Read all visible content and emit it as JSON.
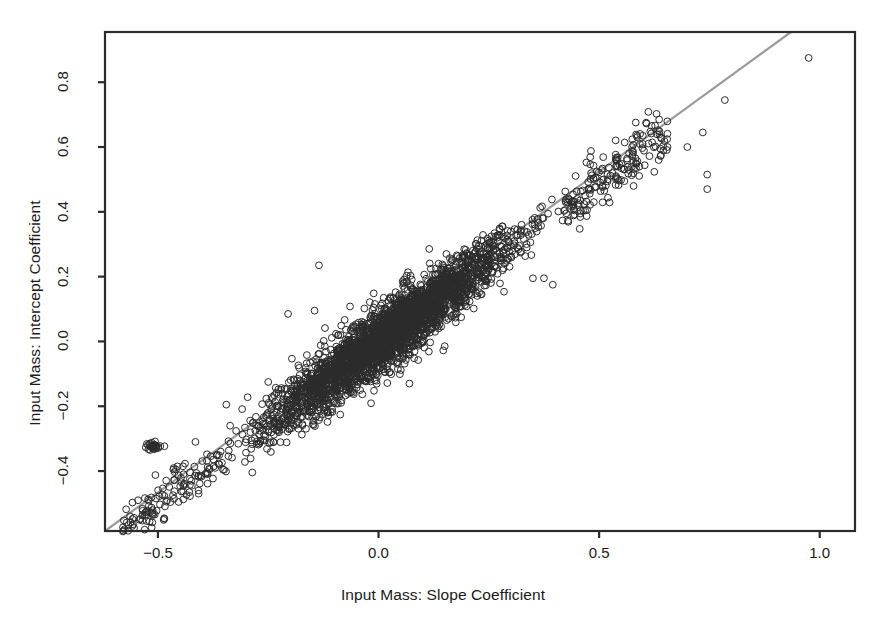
{
  "chart_data": {
    "type": "scatter",
    "title": "",
    "xlabel": "Input Mass: Slope Coefficient",
    "ylabel": "Input Mass: Intercept Coefficient",
    "xlim": [
      -0.62,
      1.08
    ],
    "ylim": [
      -0.585,
      0.955
    ],
    "xticks": [
      -0.5,
      0.0,
      0.5,
      1.0
    ],
    "xticklabels": [
      "−0.5",
      "0.0",
      "0.5",
      "1.0"
    ],
    "yticks": [
      -0.4,
      -0.2,
      0.0,
      0.2,
      0.4,
      0.6,
      0.8
    ],
    "yticklabels": [
      "−0.4",
      "−0.2",
      "0.0",
      "0.2",
      "0.4",
      "0.6",
      "0.8"
    ],
    "grid": false,
    "legend": null,
    "marker": {
      "shape": "open-circle",
      "radius_px": 3.4,
      "stroke": "#2b2b2b",
      "stroke_width": 1.0,
      "fill": "none"
    },
    "reference_line": {
      "label": "identity / fitted line",
      "color": "#9c9c9c",
      "width_px": 2.2,
      "x_start": -0.62,
      "y_start": -0.585,
      "x_end": 0.935,
      "y_end": 0.955
    },
    "relationship": {
      "description": "Near 1:1 positive linear association between slope and intercept coefficients",
      "slope": 1.0,
      "intercept": 0.0,
      "n_points": 3000
    },
    "point_cloud": {
      "core_x_range": [
        -0.56,
        0.62
      ],
      "core_y_range": [
        -0.57,
        0.62
      ],
      "scatter_sd": 0.032,
      "density_peak_x": 0.02,
      "density_peak_y": 0.02
    },
    "outlier_blob": {
      "x": -0.512,
      "y": -0.322,
      "n_points": 26,
      "spread_x": 0.012,
      "spread_y": 0.007
    },
    "notable_outliers": [
      {
        "x": 0.975,
        "y": 0.875
      },
      {
        "x": 0.785,
        "y": 0.745
      },
      {
        "x": 0.735,
        "y": 0.645
      },
      {
        "x": 0.7,
        "y": 0.6
      },
      {
        "x": 0.745,
        "y": 0.515
      },
      {
        "x": 0.745,
        "y": 0.47
      },
      {
        "x": 0.655,
        "y": 0.6
      },
      {
        "x": 0.635,
        "y": 0.56
      },
      {
        "x": -0.135,
        "y": 0.235
      },
      {
        "x": -0.145,
        "y": 0.095
      },
      {
        "x": -0.205,
        "y": 0.085
      },
      {
        "x": 0.35,
        "y": 0.195
      },
      {
        "x": 0.375,
        "y": 0.195
      },
      {
        "x": 0.395,
        "y": 0.175
      },
      {
        "x": 0.3,
        "y": 0.34
      },
      {
        "x": 0.275,
        "y": 0.345
      },
      {
        "x": -0.25,
        "y": -0.125
      },
      {
        "x": -0.345,
        "y": -0.195
      },
      {
        "x": -0.415,
        "y": -0.31
      },
      {
        "x": -0.465,
        "y": -0.395
      },
      {
        "x": -0.545,
        "y": -0.49
      },
      {
        "x": 0.07,
        "y": -0.13
      },
      {
        "x": -0.06,
        "y": -0.155
      }
    ],
    "colors": {
      "background": "#ffffff",
      "frame": "#2b2b2b",
      "marker_stroke": "#2b2b2b",
      "reference_line": "#9c9c9c",
      "text": "#1a1a1a"
    }
  },
  "axes": {
    "frame": {
      "left_px": 105,
      "right_px": 855,
      "top_px": 32,
      "bottom_px": 531,
      "line_width": 2.2
    },
    "tick_length_px": 7
  }
}
